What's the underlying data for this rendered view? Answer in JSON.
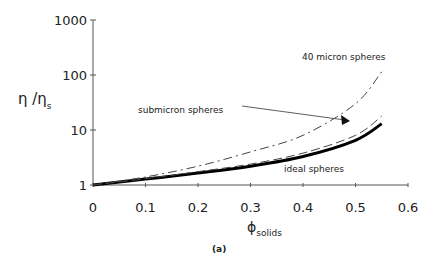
{
  "chart_data": {
    "type": "line",
    "title": "",
    "caption": "(a)",
    "xlabel": "φ solids",
    "ylabel": "η /η s",
    "xlim": [
      0,
      0.6
    ],
    "ylim": [
      1,
      1000
    ],
    "yscale": "log",
    "xticks": [
      "0",
      "0.1",
      "0.2",
      "0.3",
      "0.4",
      "0.5",
      "0.6"
    ],
    "yticks": [
      "1",
      "10",
      "100",
      "1000"
    ],
    "x": [
      0,
      0.1,
      0.2,
      0.3,
      0.4,
      0.5,
      0.55
    ],
    "series": [
      {
        "name": "ideal spheres",
        "style": "thick-solid",
        "values": [
          1,
          1.28,
          1.65,
          2.2,
          3.3,
          6.5,
          13
        ]
      },
      {
        "name": "submicron spheres",
        "style": "dashed",
        "values": [
          1,
          1.3,
          1.75,
          2.4,
          3.8,
          8,
          18
        ]
      },
      {
        "name": "40 micron spheres",
        "style": "dash-dot",
        "values": [
          1,
          1.4,
          2.2,
          4.0,
          8,
          30,
          115
        ]
      }
    ],
    "annotations": [
      "40 micron spheres",
      "submicron spheres",
      "ideal spheres"
    ]
  }
}
